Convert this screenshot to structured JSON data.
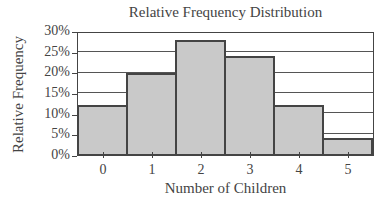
{
  "chart_data": {
    "type": "bar",
    "title": "Relative Frequency Distribution",
    "xlabel": "Number of Children",
    "ylabel": "Relative Frequency",
    "categories": [
      "0",
      "1",
      "2",
      "3",
      "4",
      "5"
    ],
    "values": [
      12,
      20,
      28,
      24,
      12,
      4
    ],
    "value_unit": "%",
    "ylim": [
      0,
      30
    ],
    "yticks": [
      "0%",
      "5%",
      "10%",
      "15%",
      "20%",
      "25%",
      "30%"
    ],
    "grid": true,
    "legend": null,
    "bar_color": "#c9c9c9",
    "edge_color": "#444444"
  }
}
